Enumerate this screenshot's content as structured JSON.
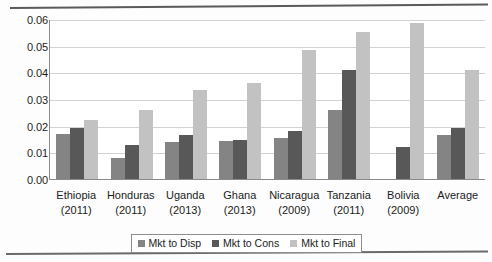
{
  "chart_data": {
    "type": "bar",
    "title": "",
    "subtitle": "",
    "xlabel": "",
    "ylabel": "",
    "ylim": [
      0,
      0.06
    ],
    "ytick_labels": [
      "0.06",
      "0.05",
      "0.04",
      "0.03",
      "0.02",
      "0.01",
      "0.00"
    ],
    "ytick_values": [
      0.06,
      0.05,
      0.04,
      0.03,
      0.02,
      0.01,
      0.0
    ],
    "grid": true,
    "legend_position": "bottom",
    "categories": [
      "Ethiopia (2011)",
      "Honduras (2011)",
      "Uganda (2013)",
      "Ghana (2013)",
      "Nicaragua (2009)",
      "Tanzania (2011)",
      "Bolivia (2009)",
      "Average"
    ],
    "category_names": [
      "Ethiopia",
      "Honduras",
      "Uganda",
      "Ghana",
      "Nicaragua",
      "Tanzania",
      "Bolivia",
      "Average"
    ],
    "category_years": [
      "(2011)",
      "(2011)",
      "(2013)",
      "(2013)",
      "(2009)",
      "(2011)",
      "(2009)",
      ""
    ],
    "series": [
      {
        "name": "Mkt to Disp",
        "color": "#848484",
        "values": [
          0.017,
          0.0078,
          0.014,
          0.0143,
          0.0155,
          0.0257,
          0.0,
          0.0165
        ]
      },
      {
        "name": "Mkt to Cons",
        "color": "#585858",
        "values": [
          0.019,
          0.0126,
          0.0165,
          0.0145,
          0.018,
          0.041,
          0.012,
          0.019
        ]
      },
      {
        "name": "Mkt to Final",
        "color": "#c2c2c2",
        "values": [
          0.022,
          0.026,
          0.0333,
          0.036,
          0.0485,
          0.055,
          0.0585,
          0.041
        ]
      }
    ]
  },
  "legend": {
    "items": [
      {
        "label": "Mkt to Disp"
      },
      {
        "label": "Mkt to Cons"
      },
      {
        "label": "Mkt to Final"
      }
    ]
  }
}
